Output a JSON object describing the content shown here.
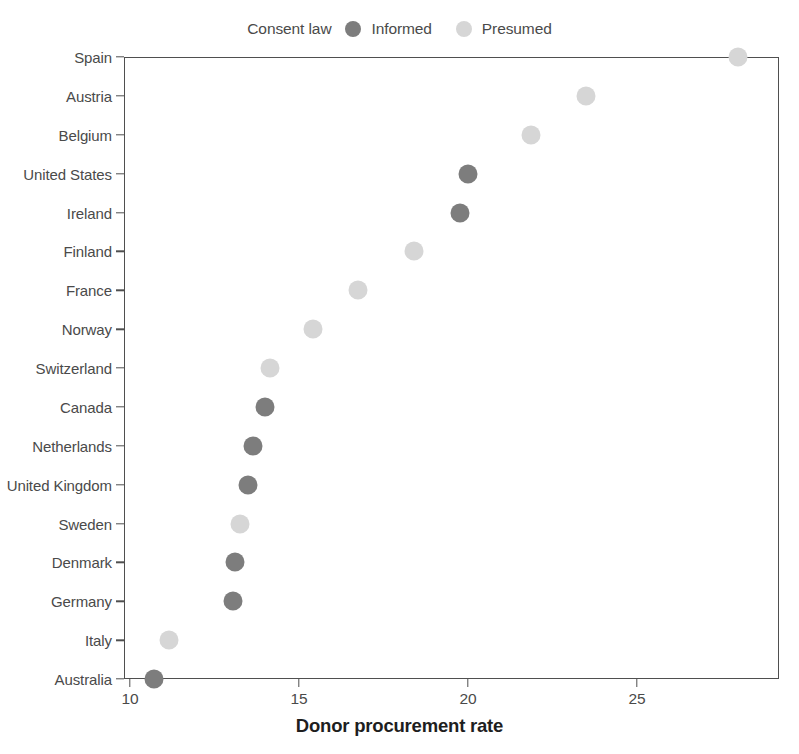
{
  "legend": {
    "title": "Consent law",
    "entries": [
      {
        "label": "Informed",
        "color": "#7d7d7d",
        "key": "informed"
      },
      {
        "label": "Presumed",
        "color": "#d6d6d6",
        "key": "presumed"
      }
    ]
  },
  "axes": {
    "x_title": "Donor procurement rate",
    "x_ticks": [
      "10",
      "15",
      "20",
      "25"
    ]
  },
  "chart_data": {
    "type": "scatter",
    "title": "",
    "subtitle": "",
    "xlabel": "Donor procurement rate",
    "ylabel": "",
    "xlim": [
      9.6,
      29.2
    ],
    "x_ticks": [
      10,
      15,
      20,
      25
    ],
    "grid": false,
    "legend_position": "top-center",
    "legend_title": "Consent law",
    "orientation": "horizontal-dot-plot",
    "categories": [
      "Spain",
      "Austria",
      "Belgium",
      "United States",
      "Ireland",
      "Finland",
      "France",
      "Norway",
      "Switzerland",
      "Canada",
      "Netherlands",
      "United Kingdom",
      "Sweden",
      "Denmark",
      "Germany",
      "Italy",
      "Australia"
    ],
    "series": [
      {
        "name": "Informed",
        "color": "#7d7d7d",
        "points": [
          {
            "category": "United States",
            "value": 20.0
          },
          {
            "category": "Ireland",
            "value": 19.75
          },
          {
            "category": "Canada",
            "value": 14.0
          },
          {
            "category": "Netherlands",
            "value": 13.65
          },
          {
            "category": "United Kingdom",
            "value": 13.5
          },
          {
            "category": "Denmark",
            "value": 13.1
          },
          {
            "category": "Germany",
            "value": 13.05
          },
          {
            "category": "Australia",
            "value": 10.7
          }
        ]
      },
      {
        "name": "Presumed",
        "color": "#d6d6d6",
        "points": [
          {
            "category": "Spain",
            "value": 28.0
          },
          {
            "category": "Austria",
            "value": 23.5
          },
          {
            "category": "Belgium",
            "value": 21.85
          },
          {
            "category": "Finland",
            "value": 18.4
          },
          {
            "category": "France",
            "value": 16.75
          },
          {
            "category": "Norway",
            "value": 15.4
          },
          {
            "category": "Switzerland",
            "value": 14.15
          },
          {
            "category": "Sweden",
            "value": 13.25
          },
          {
            "category": "Italy",
            "value": 11.15
          }
        ]
      }
    ],
    "values_by_category": [
      {
        "category": "Spain",
        "value": 28.0,
        "group": "Presumed"
      },
      {
        "category": "Austria",
        "value": 23.5,
        "group": "Presumed"
      },
      {
        "category": "Belgium",
        "value": 21.85,
        "group": "Presumed"
      },
      {
        "category": "United States",
        "value": 20.0,
        "group": "Informed"
      },
      {
        "category": "Ireland",
        "value": 19.75,
        "group": "Informed"
      },
      {
        "category": "Finland",
        "value": 18.4,
        "group": "Presumed"
      },
      {
        "category": "France",
        "value": 16.75,
        "group": "Presumed"
      },
      {
        "category": "Norway",
        "value": 15.4,
        "group": "Presumed"
      },
      {
        "category": "Switzerland",
        "value": 14.15,
        "group": "Presumed"
      },
      {
        "category": "Canada",
        "value": 14.0,
        "group": "Informed"
      },
      {
        "category": "Netherlands",
        "value": 13.65,
        "group": "Informed"
      },
      {
        "category": "United Kingdom",
        "value": 13.5,
        "group": "Informed"
      },
      {
        "category": "Sweden",
        "value": 13.25,
        "group": "Presumed"
      },
      {
        "category": "Denmark",
        "value": 13.1,
        "group": "Informed"
      },
      {
        "category": "Germany",
        "value": 13.05,
        "group": "Informed"
      },
      {
        "category": "Italy",
        "value": 11.15,
        "group": "Presumed"
      },
      {
        "category": "Australia",
        "value": 10.7,
        "group": "Informed"
      }
    ]
  }
}
